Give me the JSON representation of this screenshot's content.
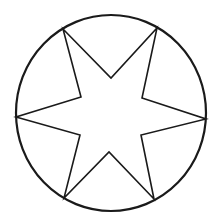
{
  "diagram": {
    "title": "",
    "colors": {
      "background": "#ffffff",
      "stroke": "#1a1a1a"
    },
    "circle": {
      "cx": 111,
      "cy": 113,
      "rx": 95,
      "ry": 98,
      "stroke_width": 2.2
    },
    "star": {
      "stroke_width": 1.6,
      "outer_vertices": [
        [
          63,
          29
        ],
        [
          157,
          28
        ],
        [
          206,
          119
        ],
        [
          154,
          199
        ],
        [
          64,
          198
        ],
        [
          16,
          117
        ]
      ],
      "inner_vertices": [
        [
          111,
          78
        ],
        [
          142,
          98
        ],
        [
          141,
          135
        ],
        [
          109,
          152
        ],
        [
          80,
          135
        ],
        [
          81,
          97
        ]
      ],
      "path_order": [
        [
          63,
          29
        ],
        [
          111,
          78
        ],
        [
          157,
          28
        ],
        [
          142,
          98
        ],
        [
          206,
          119
        ],
        [
          141,
          135
        ],
        [
          154,
          199
        ],
        [
          109,
          152
        ],
        [
          64,
          198
        ],
        [
          80,
          135
        ],
        [
          16,
          117
        ],
        [
          81,
          97
        ]
      ]
    }
  }
}
